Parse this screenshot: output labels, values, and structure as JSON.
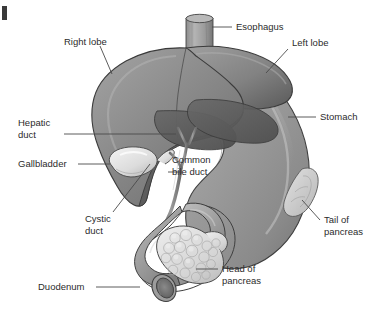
{
  "figure": {
    "style": "grayscale medical illustration",
    "background_color": "#ffffff",
    "label_color": "#2b2b2b",
    "leader_line_color": "#4a4a4a"
  },
  "labels": {
    "esophagus": "Esophagus",
    "right_lobe": "Right lobe",
    "left_lobe": "Left lobe",
    "stomach": "Stomach",
    "hepatic_duct_line1": "Hepatic",
    "hepatic_duct_line2": "duct",
    "gallbladder": "Gallbladder",
    "common_bile_duct_line1": "Common",
    "common_bile_duct_line2": "bile duct",
    "cystic_duct_line1": "Cystic",
    "cystic_duct_line2": "duct",
    "tail_of_pancreas_line1": "Tail of",
    "tail_of_pancreas_line2": "pancreas",
    "head_of_pancreas_line1": "Head of",
    "head_of_pancreas_line2": "pancreas",
    "duodenum": "Duodenum"
  },
  "organs": {
    "liver": {
      "name": "Liver",
      "fill": "#8e8e8e",
      "shadow_fill": "#5f5f5f"
    },
    "stomach": {
      "name": "Stomach",
      "fill": "#9a9a9a"
    },
    "gallbladder": {
      "name": "Gallbladder",
      "fill": "#e4e4e4"
    },
    "pancreas_head": {
      "name": "Head of pancreas",
      "fill": "#dcdcdc"
    },
    "pancreas_tail": {
      "name": "Tail of pancreas",
      "fill": "#cfcfcf"
    },
    "duodenum": {
      "name": "Duodenum",
      "fill": "#a6a6a6",
      "lumen_fill": "#6e6e6e"
    },
    "esophagus": {
      "name": "Esophagus",
      "fill": "#9d9d9d"
    },
    "ducts": {
      "name": "Biliary ducts",
      "fill": "#8a8a8a"
    }
  }
}
